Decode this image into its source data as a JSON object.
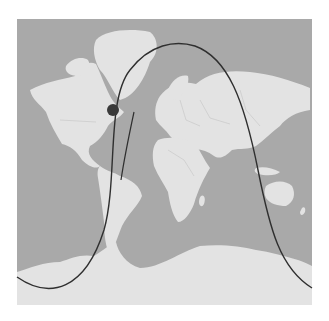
{
  "map": {
    "projection": "mercator-world",
    "colors": {
      "background": "#ffffff",
      "ocean": "#a9a9a9",
      "land": "#e3e3e3",
      "border": "#c4c4c4",
      "track": "#2f2f2f",
      "marker": "#3a3a3a"
    },
    "extent": {
      "x": 17,
      "y": 19,
      "width": 295,
      "height": 286
    },
    "marker": {
      "label": "current-position",
      "x": 113,
      "y": 110,
      "r": 6
    },
    "track": {
      "label": "ground-track",
      "path": "M17,277 C50,300 85,290 104,230 C118,180 106,100 130,70 C150,44 175,40 195,46 C228,58 244,100 258,170 C270,230 280,268 312,288"
    },
    "track_tail": {
      "label": "ground-track-continuation",
      "path": "M134,112 C128,140 124,160 121,180"
    }
  }
}
